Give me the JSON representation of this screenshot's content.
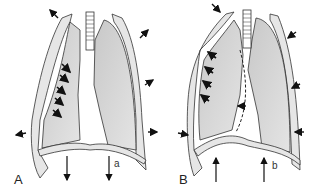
{
  "figure": {
    "panels": [
      {
        "id": "A",
        "label": "A",
        "arrow_label": "a",
        "description": "Inspiration: chest wall expands outward, diaphragm moves down; flail segment moves inward"
      },
      {
        "id": "B",
        "label": "B",
        "arrow_label": "b",
        "description": "Expiration: chest wall moves inward, diaphragm moves up; flail segment moves outward, mediastinum shifts"
      }
    ],
    "colors": {
      "lung_fill": "#d4d4d4",
      "pleura_fill": "#e6e6e6",
      "outline": "#333333",
      "arrow": "#111111",
      "background": "#ffffff"
    }
  }
}
